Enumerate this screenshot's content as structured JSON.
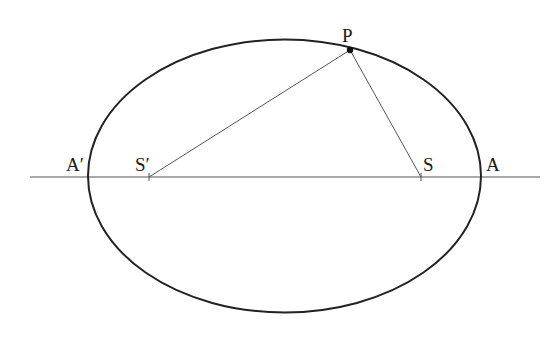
{
  "diagram": {
    "type": "ellipse-foci",
    "stroke_color": "#222222",
    "thin_line_color": "#555555",
    "ellipse": {
      "cx": 284.5,
      "cy": 176,
      "rx": 196.5,
      "ry": 136.5
    },
    "axis": {
      "x1": 30,
      "x2": 540,
      "y": 177
    },
    "points": {
      "P": {
        "label": "P",
        "x": 350,
        "y": 50
      },
      "S": {
        "label": "S",
        "x": 421,
        "y": 177
      },
      "S_prime": {
        "label": "S′",
        "x": 149,
        "y": 177
      },
      "A": {
        "label": "A",
        "x": 481,
        "y": 177
      },
      "A_prime": {
        "label": "A′",
        "x": 88,
        "y": 177
      }
    },
    "segments": [
      {
        "from": "S_prime",
        "to": "P"
      },
      {
        "from": "S",
        "to": "P"
      }
    ]
  }
}
